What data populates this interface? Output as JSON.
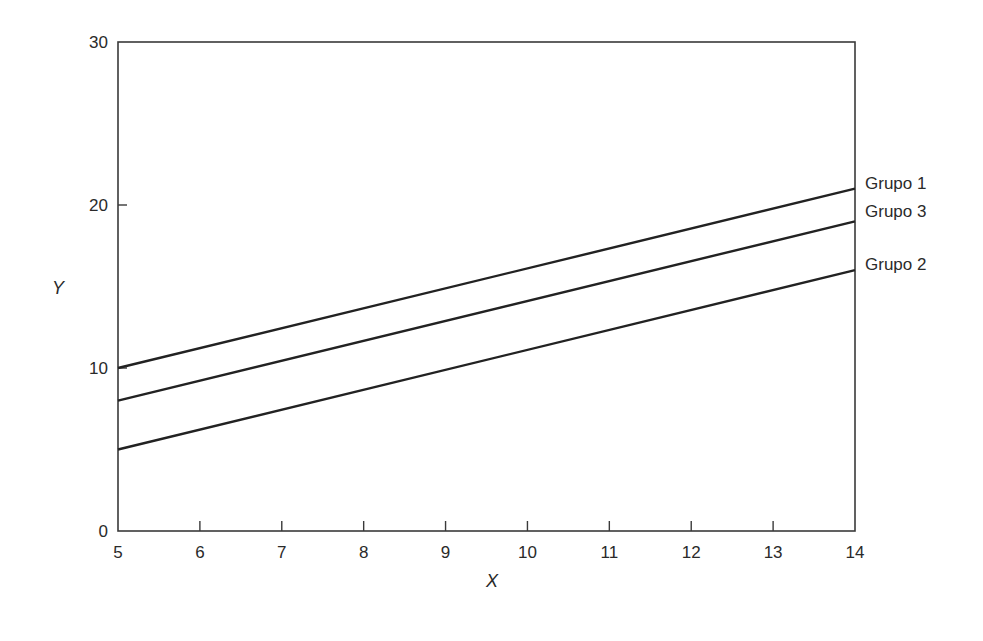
{
  "chart_data": {
    "type": "line",
    "title": "",
    "xlabel": "X",
    "ylabel": "Y",
    "xlim": [
      5,
      14
    ],
    "ylim": [
      0,
      30
    ],
    "grid": false,
    "legend_position": "inline-right",
    "x_ticks": [
      "5",
      "6",
      "7",
      "8",
      "9",
      "10",
      "11",
      "12",
      "13",
      "14"
    ],
    "y_ticks": [
      "0",
      "10",
      "20",
      "30"
    ],
    "x": [
      5,
      14
    ],
    "series": [
      {
        "name": "Grupo 1",
        "values": [
          10,
          21
        ],
        "color": "#222222"
      },
      {
        "name": "Grupo 3",
        "values": [
          8,
          19
        ],
        "color": "#222222"
      },
      {
        "name": "Grupo 2",
        "values": [
          5,
          16
        ],
        "color": "#222222"
      }
    ]
  }
}
